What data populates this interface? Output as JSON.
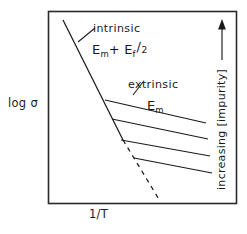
{
  "figure": {
    "axes": {
      "ylabel": "log σ",
      "xlabel": "1/T",
      "right_label": "increasing [impurity]",
      "right_arrow_direction": "up"
    },
    "annotations": {
      "intrinsic_label": "intrinsic",
      "intrinsic_activation_prefix": "E",
      "intrinsic_activation_sub1": "m",
      "intrinsic_activation_plus": "+ E",
      "intrinsic_activation_sub2": "f",
      "intrinsic_activation_slash": "/",
      "intrinsic_activation_denominator": "2",
      "extrinsic_label": "extrinsic",
      "extrinsic_activation_prefix": "E",
      "extrinsic_activation_sub": "m"
    },
    "style": {
      "line_color": "#1a1a1a",
      "frame_color": "#2a2a2a",
      "background": "#ffffff"
    }
  },
  "chart_data": {
    "type": "line",
    "title": "",
    "xlabel": "1/T",
    "ylabel": "log σ",
    "grid": false,
    "axis_ticks": false,
    "legend": "none",
    "xlim": [
      0,
      1
    ],
    "ylim": [
      0,
      1
    ],
    "series": [
      {
        "name": "intrinsic",
        "style": "solid",
        "activation_energy": "E_m + E_f/2",
        "points": [
          [
            63,
            20
          ],
          [
            123,
            140
          ]
        ]
      },
      {
        "name": "intrinsic-extrapolation",
        "style": "dashed",
        "activation_energy": "E_m + E_f/2",
        "points": [
          [
            123,
            140
          ],
          [
            160,
            201
          ]
        ]
      },
      {
        "name": "extrinsic-branch-1",
        "style": "solid",
        "activation_energy": "E_m",
        "impurity_rank": 1,
        "points": [
          [
            105,
            100
          ],
          [
            206,
            123
          ]
        ]
      },
      {
        "name": "extrinsic-branch-2",
        "style": "solid",
        "activation_energy": "E_m",
        "impurity_rank": 2,
        "points": [
          [
            112,
            119
          ],
          [
            208,
            139
          ]
        ]
      },
      {
        "name": "extrinsic-branch-3",
        "style": "solid",
        "activation_energy": "E_m",
        "impurity_rank": 3,
        "points": [
          [
            121,
            140
          ],
          [
            210,
            156
          ]
        ]
      },
      {
        "name": "extrinsic-branch-4",
        "style": "solid",
        "activation_energy": "E_m",
        "impurity_rank": 4,
        "points": [
          [
            134,
            158
          ],
          [
            212,
            173
          ]
        ]
      }
    ],
    "leaders": [
      {
        "name": "intrinsic-leader",
        "points": [
          [
            78,
            42
          ],
          [
            95,
            28
          ]
        ]
      },
      {
        "name": "extrinsic-leader",
        "points": [
          [
            133,
            95
          ],
          [
            143,
            82
          ]
        ]
      }
    ],
    "frame": {
      "x": 48,
      "y": 11,
      "width": 188,
      "height": 192
    }
  }
}
